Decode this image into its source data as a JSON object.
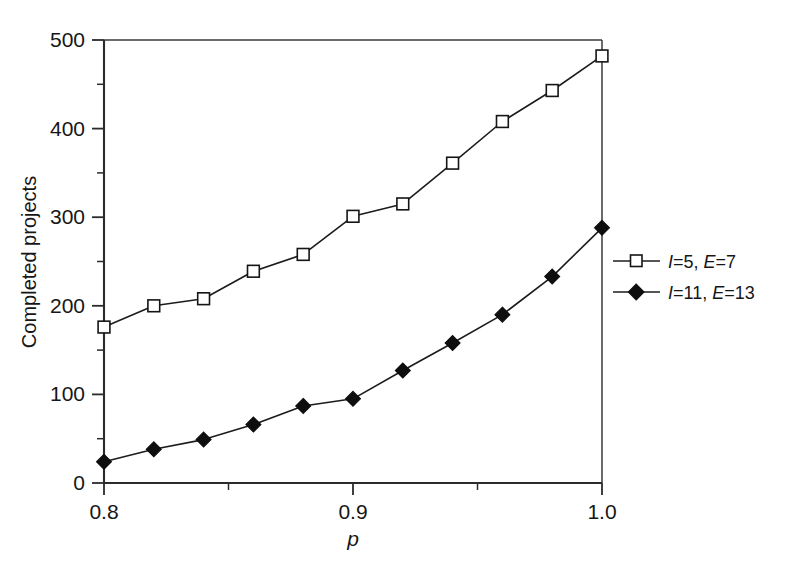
{
  "chart_data": {
    "type": "line",
    "title": "",
    "xlabel": "p",
    "ylabel": "Completed projects",
    "xlim": [
      0.8,
      1.0
    ],
    "ylim": [
      0,
      500
    ],
    "grid": false,
    "legend_position": "right",
    "x_ticks": [
      "0.8",
      "0.9",
      "1.0"
    ],
    "x_tick_values": [
      0.8,
      0.9,
      1.0
    ],
    "x_minor_ticks": [
      0.85,
      0.95
    ],
    "y_ticks": [
      "0",
      "100",
      "200",
      "300",
      "400",
      "500"
    ],
    "y_tick_values": [
      0,
      100,
      200,
      300,
      400,
      500
    ],
    "y_minor_ticks": [
      50,
      150,
      250,
      350,
      450
    ],
    "x": [
      0.8,
      0.82,
      0.84,
      0.86,
      0.88,
      0.9,
      0.92,
      0.94,
      0.96,
      0.98,
      1.0
    ],
    "series": [
      {
        "name": "I=5, E=7",
        "marker": "open-square",
        "values": [
          176,
          200,
          208,
          239,
          258,
          301,
          315,
          361,
          408,
          443,
          482
        ]
      },
      {
        "name": "I=11, E=13",
        "marker": "filled-diamond",
        "values": [
          24,
          38,
          49,
          66,
          87,
          95,
          127,
          158,
          190,
          233,
          288
        ]
      }
    ]
  },
  "legend": {
    "entries": [
      {
        "marker": "open-square",
        "sym1": "I",
        "eq1": "=5,",
        "sym2": "E",
        "eq2": "=7"
      },
      {
        "marker": "filled-diamond",
        "sym1": "I",
        "eq1": "=11,",
        "sym2": "E",
        "eq2": "=13"
      }
    ]
  },
  "caption": {
    "text": ""
  }
}
